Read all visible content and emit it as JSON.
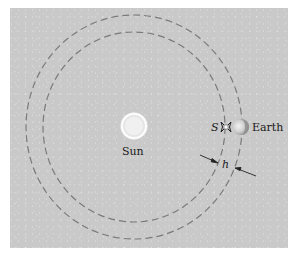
{
  "diagram": {
    "type": "orbital-diagram",
    "background_color": "#c9c9c9",
    "orbit_color": "#7a7a7a",
    "labels": {
      "sun": "Sun",
      "earth": "Earth",
      "satellite": "S",
      "gap": "h"
    },
    "elements": [
      {
        "id": "sun",
        "shape": "glowing-circle",
        "label": "Sun"
      },
      {
        "id": "inner-orbit",
        "shape": "dashed-circle"
      },
      {
        "id": "outer-orbit",
        "shape": "dashed-circle"
      },
      {
        "id": "satellite",
        "shape": "satellite-glyph",
        "label": "S"
      },
      {
        "id": "earth",
        "shape": "half-lit-sphere",
        "label": "Earth"
      },
      {
        "id": "gap-dimension",
        "shape": "dimension-arrows",
        "label": "h"
      }
    ]
  }
}
